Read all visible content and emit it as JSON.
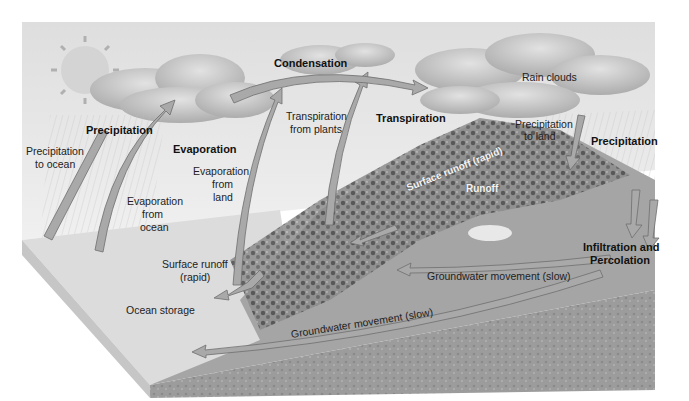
{
  "diagram": {
    "title": "",
    "style": "grayscale 3D block illustration of the water cycle",
    "colors": {
      "sky": "#e6e6e6",
      "cloud": "#c4c4c4",
      "cloud_dark": "#9e9e9e",
      "sun": "#cfcfcf",
      "ocean_top": "#dddddd",
      "ocean_side": "#c9c9c9",
      "land": "#a9a9a9",
      "ground": "#9b9b9b",
      "vegetation": "#555555",
      "arrow": "#a7a7a7",
      "arrow_stroke": "#6e6e6e"
    },
    "labels": {
      "precipitation_left": "Precipitation",
      "precipitation_to_ocean_1": "Precipitation",
      "precipitation_to_ocean_2": "to ocean",
      "evaporation": "Evaporation",
      "evaporation_from_ocean_1": "Evaporation",
      "evaporation_from_ocean_2": "from",
      "evaporation_from_ocean_3": "ocean",
      "evaporation_from_land_1": "Evaporation",
      "evaporation_from_land_2": "from",
      "evaporation_from_land_3": "land",
      "condensation": "Condensation",
      "transpiration_from_plants_1": "Transpiration",
      "transpiration_from_plants_2": "from plants",
      "transpiration": "Transpiration",
      "rain_clouds": "Rain clouds",
      "precipitation_to_land_1": "Precipitation",
      "precipitation_to_land_2": "to land",
      "precipitation_right": "Precipitation",
      "surface_runoff_rapid_hill": "Surface runoff (rapid)",
      "runoff": "Runoff",
      "surface_runoff_1": "Surface runoff",
      "surface_runoff_2": "(rapid)",
      "ocean_storage": "Ocean storage",
      "infiltration_1": "Infiltration and",
      "infiltration_2": "Percolation",
      "groundwater_upper": "Groundwater movement (slow)",
      "groundwater_lower": "Groundwater movement (slow)"
    }
  }
}
